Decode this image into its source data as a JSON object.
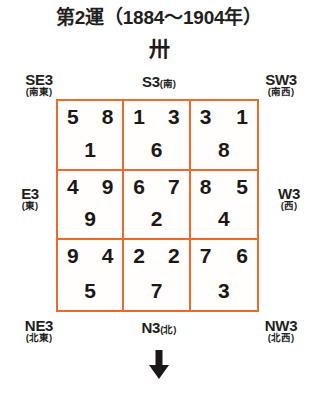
{
  "title": "第2運（1884〜1904年）",
  "era_glyph": "卅",
  "colors": {
    "grid_border": "#ec6a2d",
    "text": "#211d1c",
    "background": "#ffffff"
  },
  "labels": {
    "se": {
      "main": "SE3",
      "sub": "(南東)"
    },
    "s": {
      "main": "S3",
      "sub": "(南)"
    },
    "sw": {
      "main": "SW3",
      "sub": "(南西)"
    },
    "e": {
      "main": "E3",
      "sub": "(東)"
    },
    "w": {
      "main": "W3",
      "sub": "(西)"
    },
    "ne": {
      "main": "NE3",
      "sub": "(北東)"
    },
    "n": {
      "main": "N3",
      "sub": "(北)"
    },
    "nw": {
      "main": "NW3",
      "sub": "(北西)"
    }
  },
  "arrow": {
    "direction": "down",
    "name": "down-arrow-icon"
  },
  "grid": {
    "rows": 3,
    "cols": 3,
    "cells": [
      {
        "position": "SE3",
        "top_left": "5",
        "top_right": "8",
        "bottom": "1"
      },
      {
        "position": "S3",
        "top_left": "1",
        "top_right": "3",
        "bottom": "6"
      },
      {
        "position": "SW3",
        "top_left": "3",
        "top_right": "1",
        "bottom": "8"
      },
      {
        "position": "E3",
        "top_left": "4",
        "top_right": "9",
        "bottom": "9"
      },
      {
        "position": "C3",
        "top_left": "6",
        "top_right": "7",
        "bottom": "2"
      },
      {
        "position": "W3",
        "top_left": "8",
        "top_right": "5",
        "bottom": "4"
      },
      {
        "position": "NE3",
        "top_left": "9",
        "top_right": "4",
        "bottom": "5"
      },
      {
        "position": "N3",
        "top_left": "2",
        "top_right": "2",
        "bottom": "7"
      },
      {
        "position": "NW3",
        "top_left": "7",
        "top_right": "6",
        "bottom": "3"
      }
    ]
  }
}
